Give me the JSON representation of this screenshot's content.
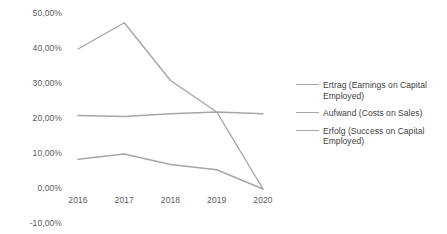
{
  "chart_data": {
    "type": "line",
    "title": "",
    "xlabel": "",
    "ylabel": "",
    "categories": [
      "2016",
      "2017",
      "2018",
      "2019",
      "2020"
    ],
    "ylim": [
      -10,
      50
    ],
    "ytick_labels": [
      "50,00%",
      "40,00%",
      "30,00%",
      "20,00%",
      "10,00%",
      "0,00%",
      "-10,00%"
    ],
    "ytick_values": [
      50,
      40,
      30,
      20,
      10,
      0,
      -10
    ],
    "grid": false,
    "legend_position": "right",
    "series": [
      {
        "name": "Ertrag (Earnings on Capital Employed)",
        "color": "#a6a6a6",
        "values": [
          8.5,
          10.0,
          7.0,
          5.5,
          0.0
        ]
      },
      {
        "name": "Aufwand (Costs on Sales)",
        "color": "#a6a6a6",
        "values": [
          21.0,
          20.7,
          21.5,
          22.0,
          21.5
        ]
      },
      {
        "name": "Erfolg (Success on Capital Employed)",
        "color": "#a6a6a6",
        "values": [
          40.0,
          47.5,
          31.0,
          22.0,
          0.0
        ]
      }
    ]
  },
  "legend": {
    "entries": [
      {
        "label": "Ertrag (Earnings on Capital Employed)"
      },
      {
        "label": "Aufwand (Costs on Sales)"
      },
      {
        "label": "Erfolg (Success on Capital Employed)"
      }
    ]
  },
  "colors": {
    "line": "#a6a6a6",
    "axis_text": "#5a5a5a",
    "legend_text": "#404040",
    "background": "#ffffff"
  }
}
